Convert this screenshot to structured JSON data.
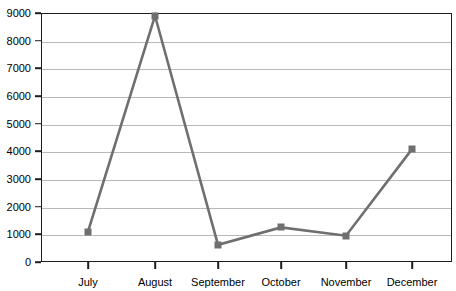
{
  "chart_data": {
    "type": "line",
    "title": "",
    "subtitle": "",
    "xlabel": "",
    "ylabel": "",
    "categories": [
      "July",
      "August",
      "September",
      "October",
      "November",
      "December"
    ],
    "values": [
      1100,
      8900,
      620,
      1250,
      950,
      4080
    ],
    "series": [
      {
        "name": "Series 1",
        "values": [
          1100,
          8900,
          620,
          1250,
          950,
          4080
        ]
      }
    ],
    "ylim": [
      0,
      9000
    ],
    "yticks": [
      0,
      1000,
      2000,
      3000,
      4000,
      5000,
      6000,
      7000,
      8000,
      9000
    ],
    "ytick_labels": [
      "0",
      "1000",
      "2000",
      "3000",
      "4000",
      "5000",
      "6000",
      "7000",
      "8000",
      "9000"
    ],
    "grid": true,
    "grid_axis": "y",
    "legend": false,
    "legend_position": "none",
    "marker": "square",
    "line_color": "#6f6f6f",
    "marker_color": "#6f6f6f",
    "grid_color": "#b9b9b9",
    "axis_color": "#1d1d1d",
    "background_color": "#ffffff"
  }
}
